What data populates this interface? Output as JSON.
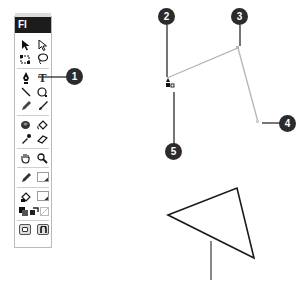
{
  "toolbox": {
    "title": "Fl",
    "rows": [
      [
        "arrow-tool",
        "subselection-tool"
      ],
      [
        "free-transform-tool",
        "lasso-tool"
      ],
      [
        "pen-tool",
        "text-tool"
      ],
      [
        "line-tool",
        "oval-tool"
      ],
      [
        "pencil-tool",
        "brush-tool"
      ],
      [
        "ink-bottle-tool",
        "paint-bucket-tool"
      ],
      [
        "eyedropper-tool",
        "eraser-tool"
      ],
      [
        "hand-tool",
        "zoom-tool"
      ],
      [
        "stroke-color",
        "stroke-swatch"
      ],
      [
        "fill-color",
        "fill-swatch"
      ],
      [
        "black-white",
        "swap-colors",
        "no-color"
      ],
      [
        "object-drawing",
        "snap-to-objects"
      ]
    ],
    "glyphs": {
      "text-tool": "T"
    }
  },
  "callouts": [
    {
      "number": "1",
      "target": "pen-tool"
    },
    {
      "number": "2",
      "target": "first anchor point"
    },
    {
      "number": "3",
      "target": "second anchor point"
    },
    {
      "number": "4",
      "target": "third anchor point"
    },
    {
      "number": "5",
      "target": "pen cursor"
    }
  ],
  "diagram": {
    "open_path_color": "#b5b5b5",
    "triangle_color": "#1a1a1a",
    "callout_color": "#2b2b2b"
  }
}
